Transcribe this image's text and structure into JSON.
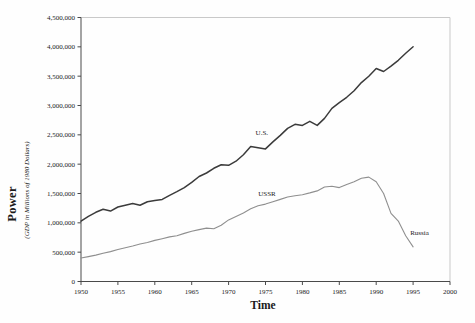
{
  "chart_data": {
    "type": "line",
    "title": "",
    "xlabel": "Time",
    "ylabel": "Power",
    "ylabel_sub": "(GDP in Millions of 1980 Dollars)",
    "xlim": [
      1950,
      2000
    ],
    "ylim": [
      0,
      4500000
    ],
    "grid": false,
    "legend": "inline-labels",
    "colors": {
      "axis": "#4a4a4a",
      "spine_light": "#c9c9c9",
      "text": "#1a1a1a"
    },
    "x_ticks": [
      {
        "v": 1950,
        "label": "1950"
      },
      {
        "v": 1955,
        "label": "1955"
      },
      {
        "v": 1960,
        "label": "1960"
      },
      {
        "v": 1965,
        "label": "1965"
      },
      {
        "v": 1970,
        "label": "1970"
      },
      {
        "v": 1975,
        "label": "1975"
      },
      {
        "v": 1980,
        "label": "1980"
      },
      {
        "v": 1985,
        "label": "1985"
      },
      {
        "v": 1990,
        "label": "1990"
      },
      {
        "v": 1995,
        "label": "1995"
      },
      {
        "v": 2000,
        "label": "2000"
      }
    ],
    "y_ticks": [
      {
        "v": 0,
        "label": "0"
      },
      {
        "v": 500000,
        "label": "500,000"
      },
      {
        "v": 1000000,
        "label": "1,000,000"
      },
      {
        "v": 1500000,
        "label": "1,500,000"
      },
      {
        "v": 2000000,
        "label": "2,000,000"
      },
      {
        "v": 2500000,
        "label": "2,500,000"
      },
      {
        "v": 3000000,
        "label": "3,000,000"
      },
      {
        "v": 3500000,
        "label": "3,500,000"
      },
      {
        "v": 4000000,
        "label": "4,000,000"
      },
      {
        "v": 4500000,
        "label": "4,500,000"
      }
    ],
    "series": [
      {
        "id": "us",
        "name": "U.S.",
        "color": "#3b3b3b",
        "width": 1.5,
        "x": [
          1950,
          1951,
          1952,
          1953,
          1954,
          1955,
          1956,
          1957,
          1958,
          1959,
          1960,
          1961,
          1962,
          1963,
          1964,
          1965,
          1966,
          1967,
          1968,
          1969,
          1970,
          1971,
          1972,
          1973,
          1974,
          1975,
          1976,
          1977,
          1978,
          1979,
          1980,
          1981,
          1982,
          1983,
          1984,
          1985,
          1986,
          1987,
          1988,
          1989,
          1990,
          1991,
          1992,
          1993,
          1994,
          1995
        ],
        "values": [
          1030000,
          1110000,
          1180000,
          1230000,
          1200000,
          1270000,
          1300000,
          1330000,
          1300000,
          1360000,
          1380000,
          1400000,
          1470000,
          1530000,
          1600000,
          1690000,
          1790000,
          1850000,
          1930000,
          1990000,
          1980000,
          2050000,
          2160000,
          2300000,
          2280000,
          2260000,
          2380000,
          2490000,
          2610000,
          2680000,
          2660000,
          2730000,
          2660000,
          2780000,
          2950000,
          3050000,
          3140000,
          3250000,
          3390000,
          3500000,
          3630000,
          3580000,
          3670000,
          3770000,
          3890000,
          4000000
        ]
      },
      {
        "id": "ussr-russia",
        "name": "USSR / Russia",
        "color": "#8f8f8f",
        "width": 1.1,
        "x": [
          1950,
          1951,
          1952,
          1953,
          1954,
          1955,
          1956,
          1957,
          1958,
          1959,
          1960,
          1961,
          1962,
          1963,
          1964,
          1965,
          1966,
          1967,
          1968,
          1969,
          1970,
          1971,
          1972,
          1973,
          1974,
          1975,
          1976,
          1977,
          1978,
          1979,
          1980,
          1981,
          1982,
          1983,
          1984,
          1985,
          1986,
          1987,
          1988,
          1989,
          1990,
          1991,
          1992,
          1993,
          1994,
          1995
        ],
        "values": [
          400000,
          425000,
          450000,
          480000,
          510000,
          545000,
          575000,
          605000,
          640000,
          665000,
          700000,
          730000,
          760000,
          780000,
          820000,
          855000,
          885000,
          910000,
          900000,
          960000,
          1050000,
          1110000,
          1170000,
          1240000,
          1290000,
          1320000,
          1360000,
          1400000,
          1440000,
          1460000,
          1480000,
          1510000,
          1545000,
          1610000,
          1625000,
          1600000,
          1655000,
          1700000,
          1760000,
          1780000,
          1700000,
          1500000,
          1160000,
          1030000,
          780000,
          590000
        ]
      }
    ],
    "annotations": [
      {
        "id": "us-label",
        "text": "U.S.",
        "year": 1974.5,
        "value": 2500000,
        "anchor": "middle"
      },
      {
        "id": "ussr-label",
        "text": "USSR",
        "year": 1975.2,
        "value": 1450000,
        "anchor": "middle"
      },
      {
        "id": "russia-label",
        "text": "Russia",
        "year": 1994.6,
        "value": 795000,
        "anchor": "start"
      }
    ]
  }
}
